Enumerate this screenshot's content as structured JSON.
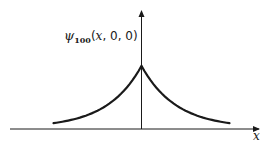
{
  "chart_data": {
    "type": "line",
    "title": "",
    "function_label": {
      "symbol": "ψ",
      "subscript": "100",
      "args": "(x, 0, 0)"
    },
    "xlabel": "x",
    "ylabel": "ψ100(x, 0, 0)",
    "x": [
      -3,
      -2.5,
      -2,
      -1.5,
      -1,
      -0.5,
      0,
      0.5,
      1,
      1.5,
      2,
      2.5,
      3
    ],
    "values": [
      0.05,
      0.08,
      0.135,
      0.22,
      0.37,
      0.61,
      1.0,
      0.61,
      0.37,
      0.22,
      0.135,
      0.08,
      0.05
    ],
    "grid": false,
    "ticks": false,
    "axis_color": "#1a1a1a",
    "curve_color": "#1a1a1a"
  },
  "labels": {
    "psi": "ψ",
    "sub": "100",
    "open": "(",
    "x": "x",
    "rest": ", 0, 0)",
    "x_axis": "x"
  }
}
